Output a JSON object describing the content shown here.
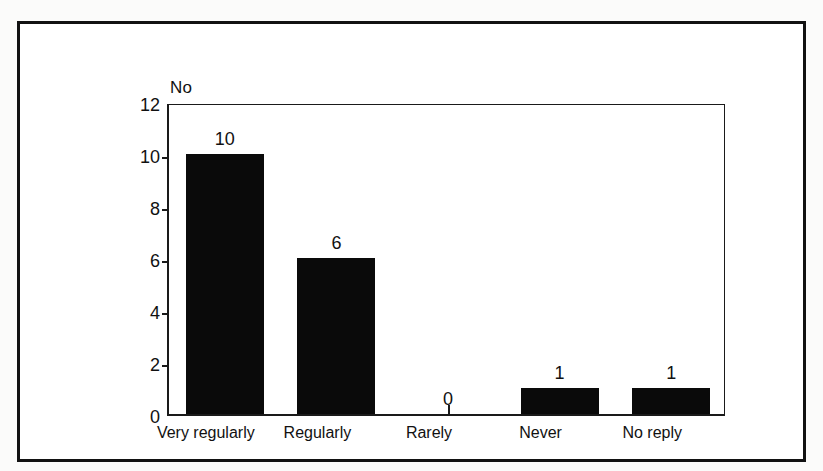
{
  "figure": {
    "axis_unit_label": "No",
    "frame_color": "#121212",
    "bar_color": "#0a0a0a",
    "background_color": "#ffffff"
  },
  "chart_data": {
    "type": "bar",
    "title": "",
    "subtitle": "",
    "xlabel": "",
    "ylabel": "No",
    "categories": [
      "Very regularly",
      "Regularly",
      "Rarely",
      "Never",
      "No reply"
    ],
    "values": [
      10,
      6,
      0,
      1,
      1
    ],
    "data_labels": [
      "10",
      "6",
      "0",
      "1",
      "1"
    ],
    "ylim": [
      0,
      12
    ],
    "yticks": [
      0,
      2,
      4,
      6,
      8,
      10,
      12
    ],
    "ytick_labels": [
      "0",
      "2",
      "4",
      "6",
      "8",
      "10",
      "12"
    ],
    "grid": false,
    "legend": false,
    "legend_position": "none",
    "series": [
      {
        "name": "No",
        "values": [
          10,
          6,
          0,
          1,
          1
        ]
      }
    ]
  }
}
